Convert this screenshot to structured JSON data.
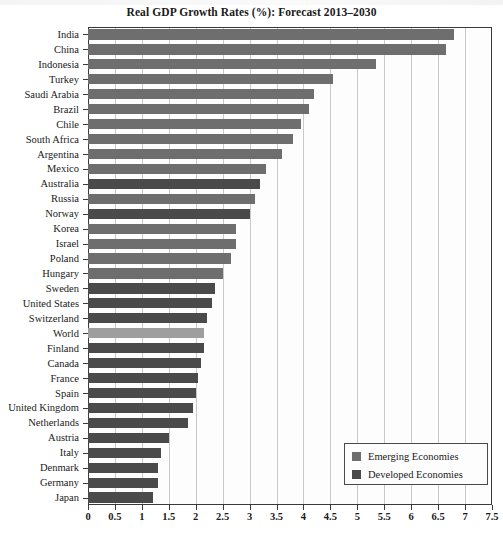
{
  "chart_data": {
    "type": "bar",
    "orientation": "horizontal",
    "title": "Real GDP Growth Rates (%): Forecast 2013–2030",
    "xlabel": "",
    "ylabel": "",
    "xlim": [
      0,
      7.5
    ],
    "xticks": [
      "0",
      "0.5",
      "1",
      "1.5",
      "2",
      "2.5",
      "3",
      "3.5",
      "4",
      "4.5",
      "5",
      "5.5",
      "6",
      "6.5",
      "7",
      "7.5"
    ],
    "xtick_values": [
      0,
      0.5,
      1,
      1.5,
      2,
      2.5,
      3,
      3.5,
      4,
      4.5,
      5,
      5.5,
      6,
      6.5,
      7,
      7.5
    ],
    "grid": true,
    "grid_axis": "x",
    "legend_position": "bottom-right",
    "categories": [
      "India",
      "China",
      "Indonesia",
      "Turkey",
      "Saudi Arabia",
      "Brazil",
      "Chile",
      "South Africa",
      "Argentina",
      "Mexico",
      "Australia",
      "Russia",
      "Norway",
      "Korea",
      "Israel",
      "Poland",
      "Hungary",
      "Sweden",
      "United States",
      "Switzerland",
      "World",
      "Finland",
      "Canada",
      "France",
      "Spain",
      "United Kingdom",
      "Netherlands",
      "Austria",
      "Italy",
      "Denmark",
      "Germany",
      "Japan"
    ],
    "values": [
      6.8,
      6.65,
      5.35,
      4.55,
      4.2,
      4.1,
      3.95,
      3.8,
      3.6,
      3.3,
      3.2,
      3.1,
      3.0,
      2.75,
      2.75,
      2.65,
      2.5,
      2.35,
      2.3,
      2.2,
      2.15,
      2.15,
      2.1,
      2.05,
      2.0,
      1.95,
      1.85,
      1.5,
      1.35,
      1.3,
      1.3,
      1.2
    ],
    "groups": [
      "emerging",
      "emerging",
      "emerging",
      "emerging",
      "emerging",
      "emerging",
      "emerging",
      "emerging",
      "emerging",
      "emerging",
      "developed",
      "emerging",
      "developed",
      "emerging",
      "emerging",
      "emerging",
      "emerging",
      "developed",
      "developed",
      "developed",
      "world",
      "developed",
      "developed",
      "developed",
      "developed",
      "developed",
      "developed",
      "developed",
      "developed",
      "developed",
      "developed",
      "developed"
    ],
    "series": [
      {
        "name": "Emerging Economies",
        "color": "#6e6e6e",
        "points": [
          {
            "category": "India",
            "value": 6.8
          },
          {
            "category": "China",
            "value": 6.65
          },
          {
            "category": "Indonesia",
            "value": 5.35
          },
          {
            "category": "Turkey",
            "value": 4.55
          },
          {
            "category": "Saudi Arabia",
            "value": 4.2
          },
          {
            "category": "Brazil",
            "value": 4.1
          },
          {
            "category": "Chile",
            "value": 3.95
          },
          {
            "category": "South Africa",
            "value": 3.8
          },
          {
            "category": "Argentina",
            "value": 3.6
          },
          {
            "category": "Mexico",
            "value": 3.3
          },
          {
            "category": "Russia",
            "value": 3.1
          },
          {
            "category": "Korea",
            "value": 2.75
          },
          {
            "category": "Israel",
            "value": 2.75
          },
          {
            "category": "Poland",
            "value": 2.65
          },
          {
            "category": "Hungary",
            "value": 2.5
          }
        ]
      },
      {
        "name": "Developed Economies",
        "color": "#4a4a4a",
        "points": [
          {
            "category": "Australia",
            "value": 3.2
          },
          {
            "category": "Norway",
            "value": 3.0
          },
          {
            "category": "Sweden",
            "value": 2.35
          },
          {
            "category": "United States",
            "value": 2.3
          },
          {
            "category": "Switzerland",
            "value": 2.2
          },
          {
            "category": "Finland",
            "value": 2.15
          },
          {
            "category": "Canada",
            "value": 2.1
          },
          {
            "category": "France",
            "value": 2.05
          },
          {
            "category": "Spain",
            "value": 2.0
          },
          {
            "category": "United Kingdom",
            "value": 1.95
          },
          {
            "category": "Netherlands",
            "value": 1.85
          },
          {
            "category": "Austria",
            "value": 1.5
          },
          {
            "category": "Italy",
            "value": 1.35
          },
          {
            "category": "Denmark",
            "value": 1.3
          },
          {
            "category": "Germany",
            "value": 1.3
          },
          {
            "category": "Japan",
            "value": 1.2
          }
        ]
      },
      {
        "name": "World",
        "color": "#9e9e9e",
        "points": [
          {
            "category": "World",
            "value": 2.15
          }
        ]
      }
    ]
  },
  "legend": {
    "items": [
      {
        "label": "Emerging Economies",
        "group": "emerging",
        "color": "#6e6e6e"
      },
      {
        "label": "Developed Economies",
        "group": "developed",
        "color": "#4a4a4a"
      }
    ]
  },
  "colors": {
    "emerging": "#6e6e6e",
    "developed": "#4a4a4a",
    "world": "#9e9e9e",
    "grid": "#c9c9c9",
    "axis": "#3a3a3a",
    "background": "#ffffff"
  }
}
